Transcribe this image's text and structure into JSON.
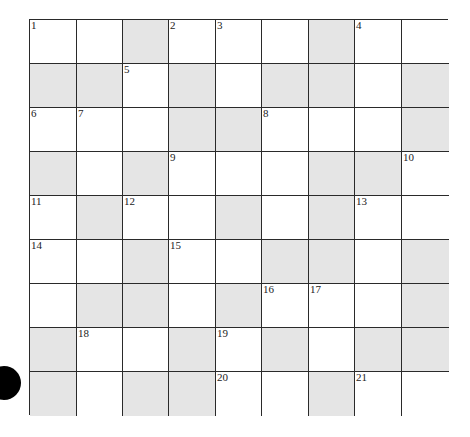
{
  "puzzle": {
    "rows": 9,
    "cols": 9,
    "colors": {
      "open": "#ffffff",
      "shaded": "#e5e5e5",
      "line": "#2a2a2a",
      "marker": "#000000"
    },
    "grid": [
      [
        "W",
        "W",
        "G",
        "W",
        "W",
        "W",
        "G",
        "W",
        "W"
      ],
      [
        "G",
        "G",
        "W",
        "G",
        "W",
        "G",
        "G",
        "W",
        "G"
      ],
      [
        "W",
        "W",
        "W",
        "G",
        "G",
        "W",
        "W",
        "W",
        "G"
      ],
      [
        "G",
        "W",
        "G",
        "W",
        "W",
        "W",
        "G",
        "G",
        "W"
      ],
      [
        "W",
        "G",
        "W",
        "W",
        "G",
        "W",
        "G",
        "W",
        "W"
      ],
      [
        "W",
        "W",
        "G",
        "W",
        "W",
        "G",
        "G",
        "W",
        "G"
      ],
      [
        "W",
        "G",
        "G",
        "W",
        "G",
        "W",
        "W",
        "W",
        "G"
      ],
      [
        "G",
        "W",
        "W",
        "G",
        "W",
        "G",
        "W",
        "G",
        "G"
      ],
      [
        "G",
        "W",
        "G",
        "G",
        "W",
        "W",
        "G",
        "W",
        "W"
      ]
    ],
    "numbers": [
      {
        "r": 0,
        "c": 0,
        "n": "1"
      },
      {
        "r": 0,
        "c": 3,
        "n": "2"
      },
      {
        "r": 0,
        "c": 4,
        "n": "3"
      },
      {
        "r": 0,
        "c": 7,
        "n": "4"
      },
      {
        "r": 1,
        "c": 2,
        "n": "5"
      },
      {
        "r": 2,
        "c": 0,
        "n": "6"
      },
      {
        "r": 2,
        "c": 1,
        "n": "7"
      },
      {
        "r": 2,
        "c": 5,
        "n": "8"
      },
      {
        "r": 3,
        "c": 3,
        "n": "9"
      },
      {
        "r": 3,
        "c": 8,
        "n": "10"
      },
      {
        "r": 4,
        "c": 0,
        "n": "11"
      },
      {
        "r": 4,
        "c": 2,
        "n": "12"
      },
      {
        "r": 4,
        "c": 7,
        "n": "13"
      },
      {
        "r": 5,
        "c": 0,
        "n": "14"
      },
      {
        "r": 5,
        "c": 3,
        "n": "15"
      },
      {
        "r": 6,
        "c": 5,
        "n": "16"
      },
      {
        "r": 6,
        "c": 6,
        "n": "17"
      },
      {
        "r": 7,
        "c": 1,
        "n": "18"
      },
      {
        "r": 7,
        "c": 4,
        "n": "19"
      },
      {
        "r": 8,
        "c": 4,
        "n": "20"
      },
      {
        "r": 8,
        "c": 7,
        "n": "21"
      }
    ]
  }
}
